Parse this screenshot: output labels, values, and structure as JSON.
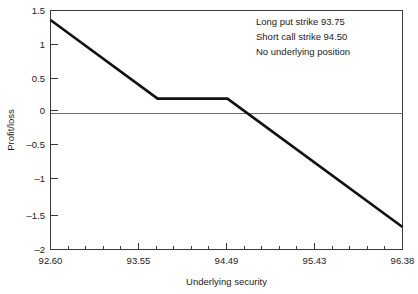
{
  "chart_data": {
    "type": "line",
    "title": "",
    "xlabel": "Underlying security",
    "ylabel": "Profit/loss",
    "xlim": [
      92.6,
      96.38
    ],
    "ylim": [
      -2,
      1.5
    ],
    "grid": false,
    "legend": null,
    "x_major_ticks": [
      "92.60",
      "93.55",
      "94.49",
      "95.43",
      "96.38"
    ],
    "x_major_values": [
      92.6,
      93.55,
      94.49,
      95.43,
      96.38
    ],
    "x_minor_per_interval": 4,
    "y_ticks": [
      "1.5",
      "1",
      "0.5",
      "0",
      "–0.5",
      "–1",
      "–1.5",
      "–2"
    ],
    "y_values": [
      1.5,
      1,
      0.5,
      0,
      -0.5,
      -1,
      -1.5,
      -2
    ],
    "zero_line": 0,
    "series": [
      {
        "name": "Profit/loss",
        "x": [
          92.6,
          93.75,
          94.5,
          96.38
        ],
        "values": [
          1.36,
          0.21,
          0.21,
          -1.67
        ]
      }
    ],
    "annotations": [
      "Long put strike 93.75",
      "Short call strike 94.50",
      "No underlying position"
    ]
  },
  "colors": {
    "payoff": "#111111",
    "frame": "#3a3a3a",
    "zero": "#6e6e6e",
    "background": "#ffffff",
    "text": "#1a1a1a"
  },
  "axes": {
    "x_title": "Underlying security",
    "y_title": "Profit/loss"
  },
  "annotation": {
    "line1": "Long put strike 93.75",
    "line2": "Short call strike 94.50",
    "line3": "No underlying position"
  },
  "xticks": {
    "t0": "92.60",
    "t1": "93.55",
    "t2": "94.49",
    "t3": "95.43",
    "t4": "96.38"
  },
  "yticks": {
    "t0": "1.5",
    "t1": "1",
    "t2": "0.5",
    "t3": "0",
    "t4": "–0.5",
    "t5": "–1",
    "t6": "–1.5",
    "t7": "–2"
  }
}
